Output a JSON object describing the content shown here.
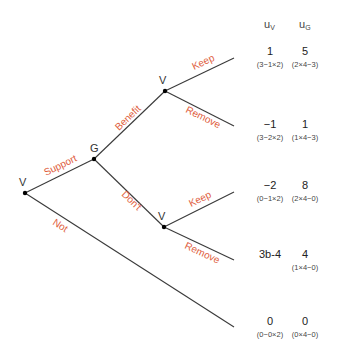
{
  "diagram": {
    "type": "game-tree",
    "colors": {
      "edge": "#3a3a3a",
      "action_label": "#e0603e",
      "node": "#000000"
    },
    "header": {
      "col1": "u",
      "col1_sub": "V",
      "col2": "u",
      "col2_sub": "G"
    },
    "nodes": {
      "root": {
        "player": "V"
      },
      "g": {
        "player": "G"
      },
      "v_upper": {
        "player": "V"
      },
      "v_lower": {
        "player": "V"
      }
    },
    "actions": {
      "support": "Support",
      "not": "Not",
      "benefit": "Benefit",
      "dont": "Don't",
      "upper_keep": "Keep",
      "upper_remove": "Remove",
      "lower_keep": "Keep",
      "lower_remove": "Remove"
    },
    "payoffs": [
      {
        "uV": "1",
        "uV_formula": "(3−1×2)",
        "uG": "5",
        "uG_formula": "(2×4−3)"
      },
      {
        "uV": "−1",
        "uV_formula": "(3−2×2)",
        "uG": "1",
        "uG_formula": "(1×4−3)"
      },
      {
        "uV": "−2",
        "uV_formula": "(0−1×2)",
        "uG": "8",
        "uG_formula": "(2×4−0)"
      },
      {
        "uV": "3b-4",
        "uV_formula": "",
        "uG": "4",
        "uG_formula": "(1×4−0)"
      },
      {
        "uV": "0",
        "uV_formula": "(0−0×2)",
        "uG": "0",
        "uG_formula": "(0×4−0)"
      }
    ]
  }
}
